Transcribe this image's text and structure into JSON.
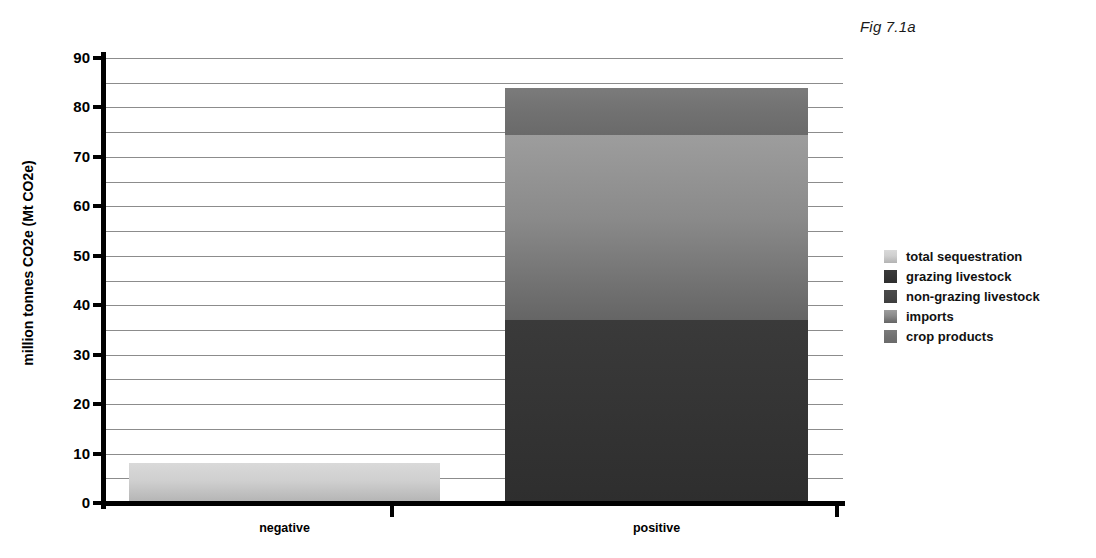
{
  "figure": {
    "label": "Fig 7.1a"
  },
  "chart_data": {
    "type": "bar",
    "stacked": true,
    "title": "Fig 7.1a",
    "xlabel": "",
    "ylabel": "million tonnes CO2e (Mt CO2e)",
    "ylim": [
      0,
      90
    ],
    "ytick_labels": [
      "0",
      "10",
      "20",
      "30",
      "40",
      "50",
      "60",
      "70",
      "80",
      "90"
    ],
    "ytick_values": [
      0,
      10,
      20,
      30,
      40,
      50,
      60,
      70,
      80,
      90
    ],
    "ytick_interval": 10,
    "gridline_interval": 5,
    "grid": true,
    "legend_position": "right",
    "categories": [
      "negative",
      "positive"
    ],
    "series": [
      {
        "name": "total sequestration",
        "color": "#cfcfcf",
        "values": [
          8.2,
          0
        ]
      },
      {
        "name": "grazing livestock",
        "color": "#343434",
        "values": [
          0,
          37.0
        ]
      },
      {
        "name": "non-grazing livestock",
        "color": "#444444",
        "values": [
          0,
          0
        ]
      },
      {
        "name": "imports",
        "color": "#8a8a8a",
        "values": [
          0,
          37.5
        ]
      },
      {
        "name": "crop products",
        "color": "#717171",
        "values": [
          0,
          9.5
        ]
      }
    ],
    "bars": [
      {
        "category": "negative",
        "total": 8.2,
        "segments": [
          {
            "name": "total sequestration",
            "from": 0,
            "to": 8.2,
            "value": 8.2
          }
        ]
      },
      {
        "category": "positive",
        "total": 84.0,
        "segments": [
          {
            "name": "grazing livestock",
            "from": 0,
            "to": 37.0,
            "value": 37.0
          },
          {
            "name": "imports",
            "from": 37.0,
            "to": 74.5,
            "value": 37.5
          },
          {
            "name": "crop products",
            "from": 74.5,
            "to": 84.0,
            "value": 9.5
          }
        ]
      }
    ]
  },
  "legend": {
    "items": [
      {
        "label": "total sequestration",
        "key": "total-sequestration"
      },
      {
        "label": "grazing livestock",
        "key": "grazing-livestock"
      },
      {
        "label": "non-grazing livestock",
        "key": "non-grazing-livestock"
      },
      {
        "label": "imports",
        "key": "imports"
      },
      {
        "label": "crop products",
        "key": "crop-products"
      }
    ]
  }
}
